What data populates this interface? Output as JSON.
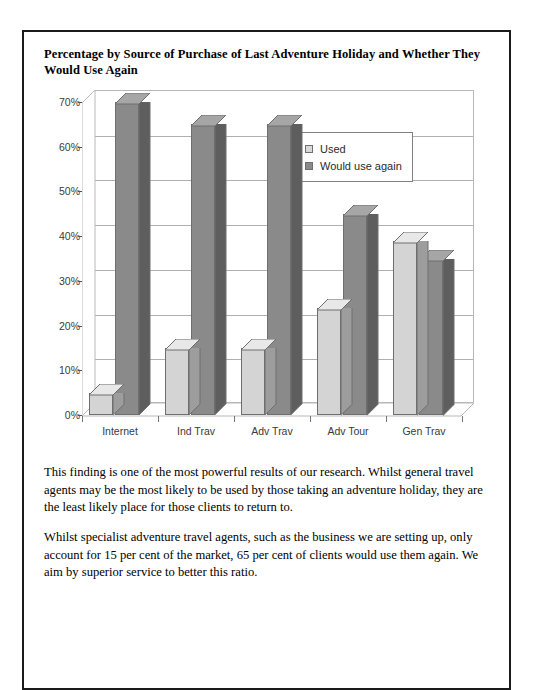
{
  "report": {
    "title": "Percentage by Source of Purchase of Last Adventure Holiday and Whether They Would Use Again",
    "paragraph_1": "This finding is one of the most powerful results of our research. Whilst general travel agents may be the most likely to be used by those taking an adventure holiday, they are the least likely place for those clients to return to.",
    "paragraph_2": "Whilst specialist adventure travel agents, such as the business we are setting up, only account for 15 per cent of the market, 65 per cent of clients would use them again. We aim by superior service to better this ratio."
  },
  "chart_data": {
    "type": "bar",
    "title": "Percentage by Source of Purchase of Last Adventure Holiday and Whether They Would Use Again",
    "xlabel": "",
    "ylabel": "",
    "categories": [
      "Internet",
      "Ind Trav",
      "Adv Trav",
      "Adv Tour",
      "Gen Trav"
    ],
    "series": [
      {
        "name": "Used",
        "values": [
          5,
          15,
          15,
          24,
          39
        ],
        "color": "#d4d4d4"
      },
      {
        "name": "Would use again",
        "values": [
          70,
          65,
          65,
          45,
          35
        ],
        "color": "#8a8a8a"
      }
    ],
    "ylim": [
      0,
      70
    ],
    "ytick_labels": [
      "70%",
      "60%",
      "50%",
      "40%",
      "30%",
      "20%",
      "10%",
      "0%"
    ],
    "ytick_values": [
      70,
      60,
      50,
      40,
      30,
      20,
      10,
      0
    ],
    "grid": true,
    "legend_position": "top-right",
    "style": "3d-column"
  },
  "legend": {
    "entries": [
      {
        "label": "Used",
        "swatch": "light-gray-square"
      },
      {
        "label": "Would use again",
        "swatch": "dark-gray-square"
      }
    ]
  }
}
